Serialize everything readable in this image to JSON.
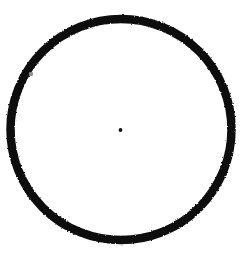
{
  "figure": {
    "background_color": "#ffffff",
    "canvas": {
      "width": 242,
      "height": 254
    },
    "shapes": {
      "circle_outline": {
        "name": "circle-outline",
        "type": "circle",
        "center_x": 121,
        "center_y": 129.5,
        "radius": 110.5,
        "stroke_color": "#111111",
        "stroke_width": 8.5,
        "fill": "none",
        "bounds": {
          "left": 6,
          "top": 15,
          "right": 236,
          "bottom": 244
        },
        "outer_diameter": 229
      },
      "center_dot": {
        "name": "center-dot",
        "type": "dot",
        "center_x": 120.5,
        "center_y": 130,
        "radius": 1.9,
        "fill_color": "#131313"
      },
      "arc_speck": {
        "name": "arc-speck",
        "type": "speck",
        "center_x": 31,
        "center_y": 74,
        "radius": 2.2,
        "fill_color": "#8d8d8d"
      }
    }
  }
}
